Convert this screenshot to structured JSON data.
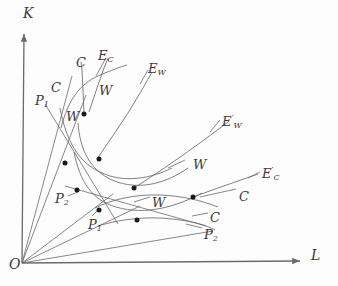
{
  "figure": {
    "kind": "economics-isoquant-expansion-path-diagram",
    "background_color": "#fdfdfd",
    "line_color": "#6a6a6a",
    "point_color": "#1a1a1a",
    "text_color": "#3a3a3a",
    "width": 338,
    "height": 286
  },
  "axes": {
    "origin_label": "O",
    "vertical_label": "K",
    "horizontal_label": "L",
    "origin_px": [
      22,
      263
    ],
    "vertical_tip_px": [
      24,
      34
    ],
    "horizontal_tip_px": [
      300,
      261
    ]
  },
  "labels": [
    {
      "name": "axis-label-K",
      "text": "K",
      "sub": "",
      "prime": false,
      "x": 23,
      "y": 6
    },
    {
      "name": "axis-label-L",
      "text": "L",
      "sub": "",
      "prime": false,
      "x": 311,
      "y": 248
    },
    {
      "name": "axis-label-O",
      "text": "O",
      "sub": "",
      "prime": false,
      "x": 9,
      "y": 257
    },
    {
      "name": "label-P1-upper",
      "text": "P",
      "sub": "1",
      "prime": false,
      "x": 35,
      "y": 94
    },
    {
      "name": "label-C-outer-upper",
      "text": "C",
      "sub": "",
      "prime": false,
      "x": 51,
      "y": 81
    },
    {
      "name": "label-C-inner-upper",
      "text": "C",
      "sub": "",
      "prime": false,
      "x": 76,
      "y": 56
    },
    {
      "name": "label-EC",
      "text": "E",
      "sub": "C",
      "prime": false,
      "x": 98,
      "y": 49
    },
    {
      "name": "label-W-upper-left",
      "text": "W",
      "sub": "",
      "prime": false,
      "x": 66,
      "y": 110
    },
    {
      "name": "label-W-upper-mid",
      "text": "W",
      "sub": "",
      "prime": false,
      "x": 99,
      "y": 84
    },
    {
      "name": "label-EW",
      "text": "E",
      "sub": "W",
      "prime": false,
      "x": 148,
      "y": 62
    },
    {
      "name": "label-EW-prime",
      "text": "E",
      "sub": "W",
      "prime": true,
      "x": 222,
      "y": 115
    },
    {
      "name": "label-W-mid-right",
      "text": "W",
      "sub": "",
      "prime": false,
      "x": 193,
      "y": 158
    },
    {
      "name": "label-EC-prime",
      "text": "E",
      "sub": "C",
      "prime": true,
      "x": 262,
      "y": 167
    },
    {
      "name": "label-C-right-upper",
      "text": "C",
      "sub": "",
      "prime": false,
      "x": 239,
      "y": 190
    },
    {
      "name": "label-P2-left",
      "text": "P",
      "sub": "2",
      "prime": false,
      "x": 55,
      "y": 192
    },
    {
      "name": "label-W-lower-mid",
      "text": "W",
      "sub": "",
      "prime": false,
      "x": 152,
      "y": 196
    },
    {
      "name": "label-P1-lower",
      "text": "P",
      "sub": "1",
      "prime": false,
      "x": 88,
      "y": 218
    },
    {
      "name": "label-C-right-lower",
      "text": "C",
      "sub": "",
      "prime": false,
      "x": 210,
      "y": 211
    },
    {
      "name": "label-P2-lower",
      "text": "P",
      "sub": "2",
      "prime": false,
      "x": 204,
      "y": 228
    }
  ],
  "rays_from_origin": [
    {
      "name": "ray-P1-upper",
      "to": [
        72,
        76
      ]
    },
    {
      "name": "ray-EC-steep",
      "to": [
        86,
        95
      ]
    },
    {
      "name": "ray-P2-mid",
      "to": [
        113,
        194
      ]
    },
    {
      "name": "ray-mid",
      "to": [
        140,
        206
      ]
    },
    {
      "name": "ray-P2-flat",
      "to": [
        213,
        231
      ]
    }
  ],
  "expansion_paths": [
    {
      "name": "path-EC",
      "label": "E_C",
      "points": "89,112 97,88 104,68 108,58"
    },
    {
      "name": "path-C-inner",
      "label": "C",
      "points": "84,114 83,90 82,70 81,62"
    },
    {
      "name": "path-EW",
      "label": "E_W",
      "points": "97,159 112,137 128,113 143,88 152,72"
    },
    {
      "name": "path-EW-prime",
      "label": "E_W'",
      "points": "134,188 160,171 186,153 212,134 228,122"
    },
    {
      "name": "path-EC-prime",
      "label": "E_C'",
      "points": "193,197 215,189 238,181 258,174"
    }
  ],
  "isoquants": [
    {
      "name": "isoquant-W-upper",
      "label": "W",
      "d": "M 61,128 C 68,100 80,84 98,76 C 112,70 120,67 127,65"
    },
    {
      "name": "isoquant-W-mid",
      "label": "W",
      "d": "M 78,123 C 80,150 90,170 112,180 C 140,192 168,182 188,168"
    },
    {
      "name": "isoquant-W-low",
      "label": "W",
      "d": "M 95,208 C 110,200 135,194 160,195 C 182,196 200,200 218,207"
    },
    {
      "name": "isoquant-C-upper",
      "label": "C",
      "d": "M 60,108 C 66,140 78,162 100,172 C 124,184 152,178 172,168"
    },
    {
      "name": "isoquant-C-mid",
      "label": "C",
      "d": "M 74,152 C 80,182 92,200 116,207 C 146,216 178,206 202,193"
    },
    {
      "name": "isoquant-C-low",
      "label": "C",
      "d": "M 98,226 C 120,219 148,216 172,219 C 192,221 206,225 215,230"
    }
  ],
  "straight_lines": [
    {
      "name": "line-P1-upper-isocost",
      "from": [
        45,
        104
      ],
      "to": [
        118,
        224
      ]
    },
    {
      "name": "line-P2-left-isocost",
      "from": [
        65,
        186
      ],
      "to": [
        206,
        226
      ]
    },
    {
      "name": "line-W-label-leader-1",
      "from": [
        185,
        160
      ],
      "to": [
        168,
        168
      ]
    },
    {
      "name": "line-W-label-leader-2",
      "from": [
        150,
        197
      ],
      "to": [
        134,
        202
      ]
    },
    {
      "name": "line-C-leader-right",
      "from": [
        236,
        189
      ],
      "to": [
        200,
        197
      ]
    },
    {
      "name": "line-C-leader-low",
      "from": [
        208,
        213
      ],
      "to": [
        192,
        216
      ]
    },
    {
      "name": "line-P2-leader-low",
      "from": [
        202,
        228
      ],
      "to": [
        186,
        224
      ]
    },
    {
      "name": "line-EC-leader",
      "from": [
        106,
        58
      ],
      "to": [
        96,
        76
      ]
    },
    {
      "name": "line-EW-leader",
      "from": [
        148,
        70
      ],
      "to": [
        140,
        84
      ]
    },
    {
      "name": "line-EWp-leader",
      "from": [
        220,
        120
      ],
      "to": [
        210,
        132
      ]
    },
    {
      "name": "line-ECp-leader",
      "from": [
        260,
        172
      ],
      "to": [
        248,
        178
      ]
    },
    {
      "name": "line-P1-leader-lower",
      "from": [
        92,
        216
      ],
      "to": [
        100,
        208
      ]
    },
    {
      "name": "line-P2-leader-left",
      "from": [
        68,
        196
      ],
      "to": [
        78,
        192
      ]
    }
  ],
  "marked_points": [
    {
      "name": "point-upper-intersection",
      "x": 84,
      "y": 114
    },
    {
      "name": "point-left-upper",
      "x": 65,
      "y": 163
    },
    {
      "name": "point-mid-upper",
      "x": 99,
      "y": 159
    },
    {
      "name": "point-P2-left",
      "x": 77,
      "y": 190
    },
    {
      "name": "point-EWprime-left",
      "x": 134,
      "y": 188
    },
    {
      "name": "point-P1-lower",
      "x": 99,
      "y": 210
    },
    {
      "name": "point-lower-mid",
      "x": 137,
      "y": 220
    },
    {
      "name": "point-ECprime-right",
      "x": 193,
      "y": 197
    }
  ]
}
